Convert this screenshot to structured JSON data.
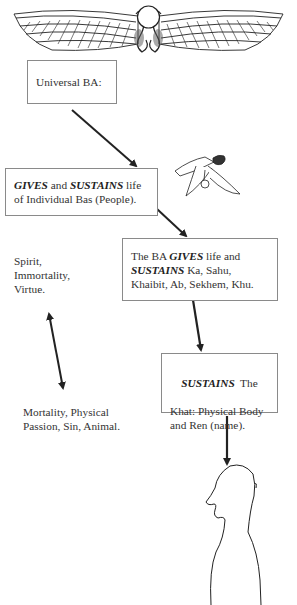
{
  "diagram": {
    "winged_disk": {
      "name": "Winged Sun Disk"
    },
    "ba_bird": {
      "name": "Ba bird"
    },
    "human_figure": {
      "name": "Human head and torso"
    },
    "boxes": [
      {
        "id": "universal-ba",
        "parts": [
          {
            "t": "Universal BA:",
            "em": false
          }
        ]
      },
      {
        "id": "individual-bas",
        "lines": [
          [
            {
              "t": "GIVES",
              "em": true
            },
            {
              "t": " and ",
              "em": false
            },
            {
              "t": "SUSTAINS",
              "em": true
            },
            {
              "t": " life",
              "em": false
            }
          ],
          [
            {
              "t": "of Individual Bas (People).",
              "em": false
            }
          ]
        ]
      },
      {
        "id": "ba-gives-life",
        "lines": [
          [
            {
              "t": "The BA ",
              "em": false
            },
            {
              "t": "GIVES",
              "em": true
            },
            {
              "t": " life and",
              "em": false
            }
          ],
          [
            {
              "t": "SUSTAINS",
              "em": true
            },
            {
              "t": " Ka, Sahu,",
              "em": false
            }
          ],
          [
            {
              "t": "Khaibit, Ab, Sekhem, Khu.",
              "em": false
            }
          ]
        ]
      },
      {
        "id": "sustains-khat",
        "lines": [
          [
            {
              "t": "SUSTAINS",
              "em": true
            },
            {
              "t": "  The",
              "em": false
            }
          ],
          [
            {
              "t": "Khat: Physical Body",
              "em": false
            }
          ],
          [
            {
              "t": "and Ren (name).",
              "em": false
            }
          ]
        ]
      }
    ],
    "labels": {
      "spirit": [
        "Spirit,",
        "Immortality,",
        "Virtue."
      ],
      "mortality": [
        "Mortality, Physical",
        "Passion, Sin, Animal."
      ]
    },
    "colors": {
      "line": "#222222",
      "box_border": "#8a8a8a",
      "text": "#333333"
    }
  }
}
